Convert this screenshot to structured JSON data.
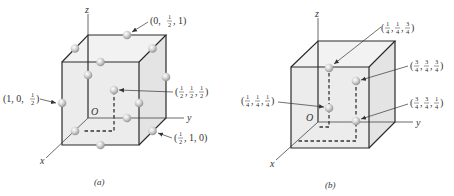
{
  "figure": {
    "panels": [
      {
        "id": "a",
        "caption": "(a)",
        "axes": {
          "x": "x",
          "y": "y",
          "z": "z",
          "origin": "O"
        },
        "labels": [
          {
            "text": "(0, 1/2, 1)",
            "parts": [
              "(0, ",
              "1",
              "2",
              ", 1)"
            ]
          },
          {
            "text": "(1, 0, 1/2)",
            "parts": [
              "(1, 0, ",
              "1",
              "2",
              ")"
            ]
          },
          {
            "text": "(1/2, 1/2, 1/2)",
            "parts": [
              "(",
              "1",
              "2",
              ", ",
              "1",
              "2",
              ", ",
              "1",
              "2",
              ")"
            ]
          },
          {
            "text": "(1/2, 1, 0)",
            "parts": [
              "(",
              "1",
              "2",
              ", 1, 0)"
            ]
          }
        ]
      },
      {
        "id": "b",
        "caption": "(b)",
        "axes": {
          "x": "x",
          "y": "y",
          "z": "z",
          "origin": "O"
        },
        "labels": [
          {
            "text": "(1/4, 1/4, 3/4)"
          },
          {
            "text": "(3/4, 3/4, 3/4)"
          },
          {
            "text": "(1/4, 1/4, 1/4)"
          },
          {
            "text": "(3/4, 3/4, 1/4)"
          }
        ]
      }
    ]
  },
  "frac": {
    "one": "1",
    "two": "2",
    "three": "3",
    "four": "4"
  },
  "sym": {
    "lp": "(",
    "rp": ")",
    "comma": ",",
    "sep": ", "
  }
}
